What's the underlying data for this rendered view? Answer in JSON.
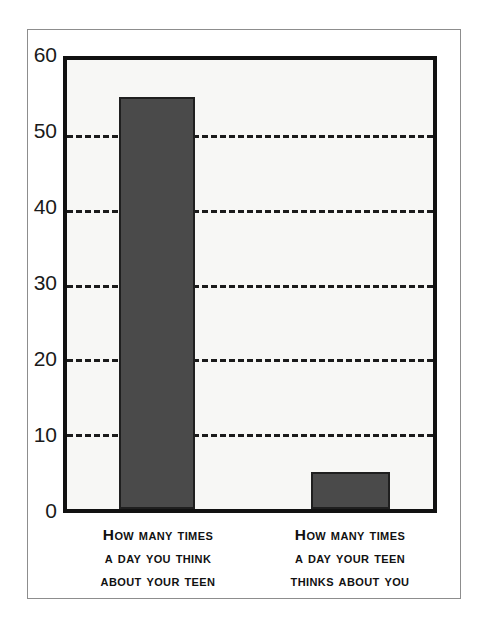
{
  "chart_data": {
    "type": "bar",
    "title": "",
    "subtitle": "",
    "xlabel": "",
    "ylabel": "",
    "categories": [
      "How many times a day you think about your teen",
      "How many times a day your teen thinks about you"
    ],
    "category_lines": [
      [
        "How many times",
        "a day you think",
        "about your teen"
      ],
      [
        "How many times",
        "a day your teen",
        "thinks about you"
      ]
    ],
    "values": [
      55,
      5
    ],
    "ylim": [
      0,
      60
    ],
    "yticks": [
      0,
      10,
      20,
      30,
      40,
      50,
      60
    ],
    "ytick_labels": [
      "0",
      "10",
      "20",
      "30",
      "40",
      "50",
      "60"
    ],
    "grid": true,
    "gridline_values": [
      10,
      20,
      30,
      40,
      50
    ],
    "gridline_style": "dashed",
    "legend": false,
    "legend_position": "none",
    "annotations": [],
    "colors": {
      "bar_fill": "#4a4a4a",
      "bar_edge": "#1f1f1f",
      "plot_background": "#f7f7f5",
      "plot_border": "#111111",
      "gridline": "#1b1b1b",
      "tick_label": "#1a1a1a",
      "category_label": "#111111",
      "figure_background": "#ffffff",
      "outer_frame": "#8d8d8d"
    }
  }
}
